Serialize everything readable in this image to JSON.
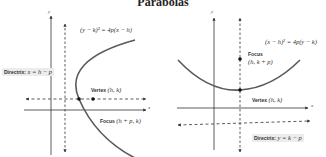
{
  "title": "Parabolas",
  "left": {
    "equation": "(y − k)² = 4p(x − h)",
    "directrix_label": "Directrix:",
    "directrix_eq": "x = h − p",
    "vertex_label": "Vertex",
    "vertex_coords": "(h, k)",
    "focus_label": "Focus",
    "focus_coords": "(h + p, k)",
    "x_axis": "x",
    "y_axis": "y"
  },
  "right": {
    "equation": "(x − h)² = 4p(y − k)",
    "focus_label": "Focus",
    "focus_coords": "(h, k + p)",
    "vertex_label": "Vertex",
    "vertex_coords": "(h, k)",
    "directrix_label": "Directrix:",
    "directrix_eq": "y = k − p",
    "x_axis": "x",
    "y_axis": "y"
  },
  "colors": {
    "curve": "#5a5a5a",
    "axes": "#333333",
    "label_bg": "#ececec"
  }
}
